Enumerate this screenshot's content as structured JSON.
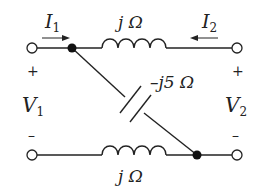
{
  "diagram": {
    "type": "two-port circuit",
    "labels": {
      "I1": "I",
      "I1_sub": "1",
      "I2": "I",
      "I2_sub": "2",
      "V1": "V",
      "V1_sub": "1",
      "V2": "V",
      "V2_sub": "2",
      "plus": "+",
      "minus": "–",
      "top_inductor": "j Ω",
      "bottom_inductor": "j Ω",
      "capacitor": "–j5 Ω"
    },
    "components": [
      {
        "name": "top-inductor",
        "type": "inductor",
        "impedance": "j Ω"
      },
      {
        "name": "bottom-inductor",
        "type": "inductor",
        "impedance": "j Ω"
      },
      {
        "name": "diagonal-capacitor",
        "type": "capacitor",
        "impedance": "–j5 Ω"
      }
    ],
    "color": "#222222"
  }
}
